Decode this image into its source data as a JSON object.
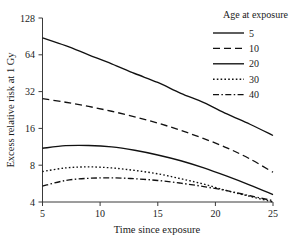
{
  "chart_data": {
    "type": "line",
    "title": "",
    "xlabel": "Time since exposure",
    "ylabel": "Excess relative risk at 1 Gy",
    "xlim": [
      5,
      25
    ],
    "ylim": [
      4,
      128
    ],
    "yscale": "log2",
    "grid": false,
    "legend_position": "top-right",
    "legend_title": "Age at exposure",
    "xticks": [
      5,
      10,
      15,
      20,
      25
    ],
    "xticklabels": [
      "5",
      "10",
      "15",
      "20",
      "25"
    ],
    "yticks": [
      4,
      8,
      16,
      32,
      64,
      128
    ],
    "yticklabels": [
      "4",
      "8",
      "16",
      "32",
      "64",
      "128"
    ],
    "x": [
      5,
      7,
      9,
      11,
      13,
      15,
      17,
      19,
      21,
      23,
      25
    ],
    "series": [
      {
        "name": "5",
        "label": "5",
        "linestyle": "solid",
        "dasharray": "none",
        "color": "#111111",
        "values": [
          88,
          76,
          64,
          54,
          45,
          38,
          31,
          26,
          21,
          17.3,
          14
        ]
      },
      {
        "name": "10",
        "label": "10",
        "linestyle": "dashed",
        "dasharray": "7,4",
        "color": "#111111",
        "values": [
          28,
          26.2,
          24.2,
          22.1,
          19.9,
          17.7,
          15.4,
          13.2,
          11.1,
          9.0,
          7.0
        ]
      },
      {
        "name": "20",
        "label": "20",
        "linestyle": "solid",
        "dasharray": "none",
        "color": "#111111",
        "values": [
          11.0,
          11.55,
          11.6,
          11.3,
          10.6,
          9.7,
          8.7,
          7.6,
          6.5,
          5.5,
          4.6
        ]
      },
      {
        "name": "30",
        "label": "30",
        "linestyle": "dotted",
        "dasharray": "1.6,2.2",
        "color": "#111111",
        "values": [
          7.1,
          7.6,
          7.75,
          7.6,
          7.25,
          6.8,
          6.2,
          5.6,
          4.95,
          4.45,
          4.0
        ]
      },
      {
        "name": "40",
        "label": "40",
        "linestyle": "dashdot",
        "dasharray": "6,2.4,1.5,2.4",
        "color": "#111111",
        "values": [
          5.4,
          6.0,
          6.25,
          6.3,
          6.2,
          6.0,
          5.7,
          5.35,
          4.95,
          4.5,
          4.1
        ]
      }
    ]
  },
  "axes": {
    "x_title": "Time since exposure",
    "y_title": "Excess relative risk at 1 Gy"
  },
  "legend": {
    "title": "Age at exposure",
    "entries": [
      {
        "label": "5"
      },
      {
        "label": "10"
      },
      {
        "label": "20"
      },
      {
        "label": "30"
      },
      {
        "label": "40"
      }
    ]
  }
}
